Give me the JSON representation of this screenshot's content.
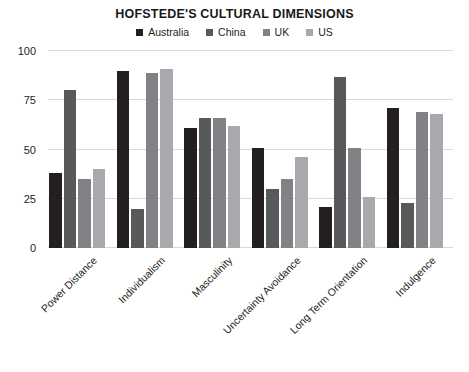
{
  "chart_data": {
    "type": "bar",
    "title": "HOFSTEDE'S CULTURAL DIMENSIONS",
    "xlabel": "",
    "ylabel": "",
    "ylim": [
      0,
      100
    ],
    "yticks": [
      0,
      25,
      50,
      75,
      100
    ],
    "grid": true,
    "legend_position": "top-center",
    "categories": [
      "Power Distance",
      "Individualism",
      "Masculinity",
      "Uncertainty Avoidance",
      "Long Term Orientation",
      "Indulgence"
    ],
    "series": [
      {
        "name": "Australia",
        "color": "#231f20",
        "values": [
          38,
          90,
          61,
          51,
          21,
          71
        ]
      },
      {
        "name": "China",
        "color": "#58595b",
        "values": [
          80,
          20,
          66,
          30,
          87,
          23
        ]
      },
      {
        "name": "UK",
        "color": "#808285",
        "values": [
          35,
          89,
          66,
          35,
          51,
          69
        ]
      },
      {
        "name": "US",
        "color": "#a7a9ac",
        "values": [
          40,
          91,
          62,
          46,
          26,
          68
        ]
      }
    ]
  },
  "legend": {
    "items": [
      {
        "label": "Australia",
        "color": "#231f20"
      },
      {
        "label": "China",
        "color": "#58595b"
      },
      {
        "label": "UK",
        "color": "#808285"
      },
      {
        "label": "US",
        "color": "#a7a9ac"
      }
    ]
  },
  "axis": {
    "y_tick_labels": [
      "100",
      "75",
      "50",
      "25",
      "0"
    ]
  },
  "colors": {
    "gridline": "#d9d9d9",
    "text": "#231f20",
    "background": "#ffffff"
  }
}
